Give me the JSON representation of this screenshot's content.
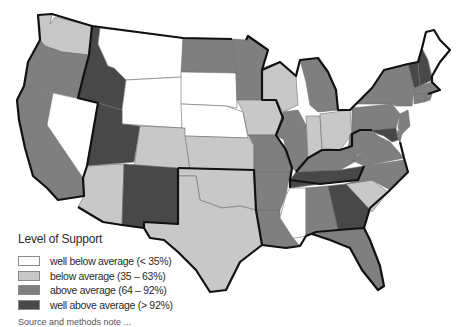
{
  "legend": {
    "title": "Level of Support",
    "items": [
      {
        "key": "wba",
        "label": "well below average (< 35%)",
        "color": "#ffffff"
      },
      {
        "key": "ba",
        "label": "below average (35 – 63%)",
        "color": "#c8c8c8"
      },
      {
        "key": "aa",
        "label": "above average (64 – 92%)",
        "color": "#7f7f7f"
      },
      {
        "key": "waa",
        "label": "well above average (> 92%)",
        "color": "#484848"
      }
    ]
  },
  "states": {
    "WA": "ba",
    "OR": "aa",
    "CA": "aa",
    "NV": "wba",
    "ID": "waa",
    "MT": "wba",
    "WY": "wba",
    "UT": "waa",
    "AZ": "ba",
    "CO": "ba",
    "NM": "waa",
    "ND": "aa",
    "SD": "wba",
    "NE": "wba",
    "KS": "ba",
    "OK": "ba",
    "TX": "ba",
    "MN": "aa",
    "IA": "ba",
    "MO": "aa",
    "AR": "aa",
    "LA": "aa",
    "WI": "ba",
    "IL": "aa",
    "MI": "aa",
    "IN": "ba",
    "OH": "ba",
    "KY": "aa",
    "TN": "waa",
    "MS": "wba",
    "AL": "aa",
    "GA": "waa",
    "FL": "aa",
    "SC": "ba",
    "NC": "aa",
    "VA": "aa",
    "WV": "aa",
    "PA": "aa",
    "NY": "aa",
    "VT": "waa",
    "NH": "waa",
    "ME": "wba",
    "MA": "aa",
    "CT": "aa",
    "RI": "aa",
    "NJ": "aa",
    "DE": "aa",
    "MD": "waa"
  },
  "footer": {
    "cutoff_text": "Source and methods note ..."
  }
}
